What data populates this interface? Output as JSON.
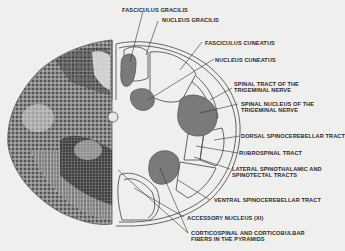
{
  "figure": {
    "colors": {
      "background": "#efefed",
      "nucleus_fill": "#7a7a7a",
      "outline": "#555555",
      "stained_tissue": "#4a4a4a",
      "label_text": "#2a2a2a"
    },
    "labels": [
      {
        "id": "fasciculus-gracilis",
        "line1": "FASCICULUS GRACILIS",
        "line2": ""
      },
      {
        "id": "nucleus-gracilis",
        "line1": "NUCLEUS GRACILIS",
        "line2": ""
      },
      {
        "id": "fasciculus-cuneatus",
        "line1": "FASCICULUS CUNEATUS",
        "line2": ""
      },
      {
        "id": "nucleus-cuneatus",
        "line1": "NUCLEUS CUNEATUS",
        "line2": ""
      },
      {
        "id": "spinal-tract-trigeminal",
        "line1": "SPINAL TRACT OF THE",
        "line2": "TRIGEMINAL NERVE"
      },
      {
        "id": "spinal-nucleus-trigeminal",
        "line1": "SPINAL NUCLEUS OF THE",
        "line2": "TRIGEMINAL NERVE"
      },
      {
        "id": "dorsal-spinocerebellar",
        "line1": "DORSAL SPINOCEREBELLAR TRACT",
        "line2": ""
      },
      {
        "id": "rubrospinal",
        "line1": "RUBROSPINAL TRACT",
        "line2": ""
      },
      {
        "id": "lateral-spinothalamic",
        "line1": "LATERAL SPINOTHALAMIC AND",
        "line2": "SPINOTECTAL TRACTS"
      },
      {
        "id": "ventral-spinocerebellar",
        "line1": "VENTRAL SPINOCEREBELLAR TRACT",
        "line2": ""
      },
      {
        "id": "accessory-nucleus",
        "line1": "ACCESSORY NUCLEUS (XI)",
        "line2": ""
      },
      {
        "id": "corticospinal",
        "line1": "CORTICOSPINAL AND CORTICOBULBAR",
        "line2": "FIBERS IN THE PYRAMIDS"
      }
    ]
  }
}
